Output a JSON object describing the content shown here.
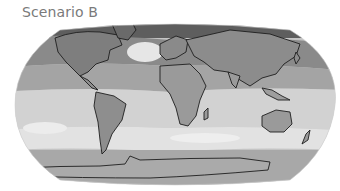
{
  "figure": {
    "title": "Scenario B",
    "projection": "Robinson-like (elliptical world map)",
    "colormap": "grayscale",
    "colors": {
      "darkest": "#5a5a5a",
      "dark": "#7e7e7e",
      "mid": "#9c9c9c",
      "light": "#bdbdbd",
      "lighter": "#d6d6d6",
      "lightest": "#ececec",
      "coastline": "#1e1e1e"
    }
  }
}
